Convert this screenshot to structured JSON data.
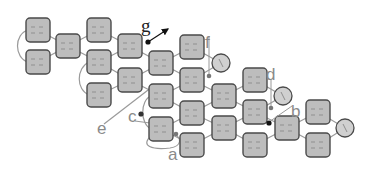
{
  "diagram": {
    "type": "network-of-coupled-boxes",
    "colors": {
      "box_fill": "#bdbdbd",
      "box_stroke": "#4a4a4a",
      "edge": "#9a9a9a",
      "circle_fill": "#d0d0d0",
      "label_gray": "#8a8a8a",
      "label_dark": "#222222",
      "dot_dark": "#111111",
      "dot_gray": "#777777"
    },
    "nodes": [
      {
        "id": "n1",
        "x": 38,
        "y": 30
      },
      {
        "id": "n2",
        "x": 38,
        "y": 62
      },
      {
        "id": "n3",
        "x": 68,
        "y": 46
      },
      {
        "id": "n4",
        "x": 99,
        "y": 30
      },
      {
        "id": "n5",
        "x": 99,
        "y": 62
      },
      {
        "id": "n6",
        "x": 99,
        "y": 95
      },
      {
        "id": "n7",
        "x": 130,
        "y": 46
      },
      {
        "id": "n8",
        "x": 130,
        "y": 80
      },
      {
        "id": "n9",
        "x": 161,
        "y": 63
      },
      {
        "id": "n10",
        "x": 161,
        "y": 96
      },
      {
        "id": "n11",
        "x": 161,
        "y": 129
      },
      {
        "id": "n12",
        "x": 192,
        "y": 47
      },
      {
        "id": "n13",
        "x": 192,
        "y": 80
      },
      {
        "id": "n14",
        "x": 192,
        "y": 113
      },
      {
        "id": "n15",
        "x": 192,
        "y": 145
      },
      {
        "id": "n16",
        "x": 224,
        "y": 96
      },
      {
        "id": "n17",
        "x": 224,
        "y": 128
      },
      {
        "id": "n18",
        "x": 255,
        "y": 80
      },
      {
        "id": "n19",
        "x": 255,
        "y": 112
      },
      {
        "id": "n20",
        "x": 255,
        "y": 145
      },
      {
        "id": "n21",
        "x": 287,
        "y": 128
      },
      {
        "id": "n22",
        "x": 318,
        "y": 112
      },
      {
        "id": "n23",
        "x": 318,
        "y": 145
      }
    ],
    "circles": [
      {
        "id": "cf",
        "x": 221,
        "y": 63,
        "r": 9
      },
      {
        "id": "cd",
        "x": 283,
        "y": 96,
        "r": 9
      },
      {
        "id": "cr",
        "x": 345,
        "y": 128,
        "r": 9
      }
    ],
    "edges": [
      [
        "n1",
        "n3"
      ],
      [
        "n2",
        "n3"
      ],
      [
        "n3",
        "n4"
      ],
      [
        "n3",
        "n5"
      ],
      [
        "n4",
        "n7"
      ],
      [
        "n5",
        "n7"
      ],
      [
        "n5",
        "n8"
      ],
      [
        "n6",
        "n8"
      ],
      [
        "n7",
        "n9"
      ],
      [
        "n8",
        "n9"
      ],
      [
        "n8",
        "n10"
      ],
      [
        "n9",
        "n12"
      ],
      [
        "n9",
        "n13"
      ],
      [
        "n10",
        "n13"
      ],
      [
        "n10",
        "n14"
      ],
      [
        "n11",
        "n14"
      ],
      [
        "n11",
        "n15"
      ],
      [
        "n12",
        "cf"
      ],
      [
        "n13",
        "cf"
      ],
      [
        "n13",
        "n16"
      ],
      [
        "n14",
        "n16"
      ],
      [
        "n14",
        "n17"
      ],
      [
        "n15",
        "n17"
      ],
      [
        "n16",
        "n18"
      ],
      [
        "n16",
        "n19"
      ],
      [
        "n17",
        "n19"
      ],
      [
        "n17",
        "n20"
      ],
      [
        "n18",
        "cd"
      ],
      [
        "n19",
        "cd"
      ],
      [
        "n19",
        "n21"
      ],
      [
        "n20",
        "n21"
      ],
      [
        "n21",
        "n22"
      ],
      [
        "n21",
        "n23"
      ],
      [
        "n22",
        "cr"
      ],
      [
        "n23",
        "cr"
      ]
    ],
    "labels": {
      "a": "a",
      "b": "b",
      "c": "c",
      "d": "d",
      "e": "e",
      "f": "f",
      "g": "g"
    }
  }
}
